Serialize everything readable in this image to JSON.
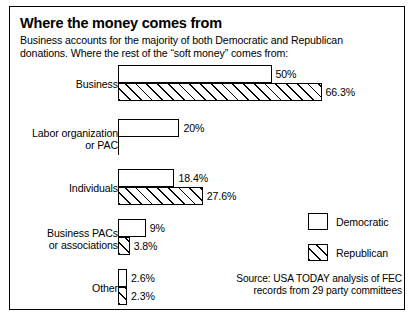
{
  "title": "Where the money comes from",
  "subtitle": "Business accounts for the majority of both Democratic and Republican donations. Where the rest of the “soft money” comes from:",
  "legend": {
    "democratic": "Democratic",
    "republican": "Republican"
  },
  "source": "Source: USA TODAY analysis of FEC records from 29 party committees",
  "chart_data": {
    "type": "bar",
    "orientation": "horizontal",
    "title": "Where the money comes from",
    "subtitle": "Business accounts for the majority of both Democratic and Republican donations. Where the rest of the “soft money” comes from:",
    "xlabel": "",
    "ylabel": "",
    "xlim": [
      0,
      70
    ],
    "grid": false,
    "legend_position": "middle-right",
    "categories": [
      "Business",
      "Labor organization or PAC",
      "Individuals",
      "Business PACs or associations",
      "Other"
    ],
    "series": [
      {
        "name": "Democratic",
        "values": [
          50,
          20,
          18.4,
          9,
          2.6
        ],
        "labels": [
          "50%",
          "20%",
          "18.4%",
          "9%",
          "2.6%"
        ],
        "fill": "white"
      },
      {
        "name": "Republican",
        "values": [
          66.3,
          null,
          27.6,
          3.8,
          2.3
        ],
        "labels": [
          "66.3%",
          null,
          "27.6%",
          "3.8%",
          "2.3%"
        ],
        "fill": "diagonal-hatch"
      }
    ],
    "groups": [
      {
        "label": "Business",
        "top": 0,
        "dem": {
          "value": 50,
          "label": "50%"
        },
        "rep": {
          "value": 66.3,
          "label": "66.3%"
        }
      },
      {
        "label": "Labor organization\nor PAC",
        "top": 54,
        "dem": {
          "value": 20,
          "label": "20%"
        },
        "rep": {
          "value": null,
          "label": null
        }
      },
      {
        "label": "Individuals",
        "top": 104,
        "dem": {
          "value": 18.4,
          "label": "18.4%"
        },
        "rep": {
          "value": 27.6,
          "label": "27.6%"
        }
      },
      {
        "label": "Business PACs\nor associations",
        "top": 154,
        "dem": {
          "value": 9,
          "label": "9%"
        },
        "rep": {
          "value": 3.8,
          "label": "3.8%"
        }
      },
      {
        "label": "Other",
        "top": 204,
        "dem": {
          "value": 2.6,
          "label": "2.6%"
        },
        "rep": {
          "value": 2.3,
          "label": "2.3%"
        }
      }
    ],
    "colors": {
      "ink": "#000000",
      "background": "#ffffff"
    }
  }
}
